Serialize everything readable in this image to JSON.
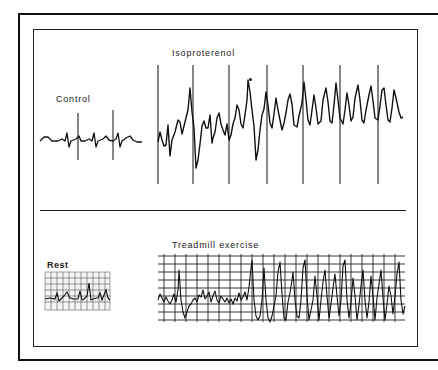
{
  "figure": {
    "panels": [
      {
        "id": "control",
        "label": "Control"
      },
      {
        "id": "isoproterenol",
        "label": "Isoproterenol",
        "annotation": "•"
      },
      {
        "id": "rest",
        "label": "Rest"
      },
      {
        "id": "treadmill",
        "label": "Treadmill exercise"
      }
    ]
  },
  "colors": {
    "ink": "#111111",
    "grid": "#555555",
    "background": "#ffffff"
  }
}
